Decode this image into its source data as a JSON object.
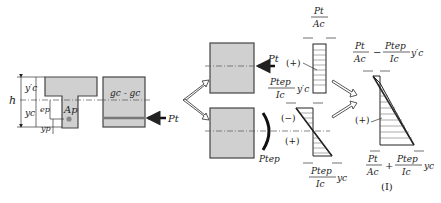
{
  "figure": {
    "section": {
      "labels": {
        "h": "h",
        "yc_prime": "y′c",
        "yc": "yc",
        "ep": "ep",
        "yp": "yp",
        "Ap": "Ap"
      }
    },
    "elevation": {
      "axis_label": "gc - gc",
      "force_label": "Pt"
    },
    "components": {
      "axial": {
        "force_label": "Pt",
        "sign": "(+)",
        "top_num": "Pt",
        "top_den": "Ac"
      },
      "moment": {
        "moment_label": "Ptep",
        "sign_top": "(−)",
        "sign_bottom": "(+)",
        "top_num": "Ptep",
        "top_den": "Ic",
        "top_var": "y′c",
        "bot_num": "Ptep",
        "bot_den": "Ic",
        "bot_var": "yc"
      }
    },
    "result": {
      "top_formula": {
        "t1_num": "Pt",
        "t1_den": "Ac",
        "op": "−",
        "t2_num": "Ptep",
        "t2_den": "Ic",
        "var": "y′c"
      },
      "bottom_formula": {
        "t1_num": "Pt",
        "t1_den": "Ac",
        "op": "+",
        "t2_num": "Ptep",
        "t2_den": "Ic",
        "var": "yc"
      },
      "sign": "(+)",
      "case_label": "(Ⅰ)"
    }
  }
}
